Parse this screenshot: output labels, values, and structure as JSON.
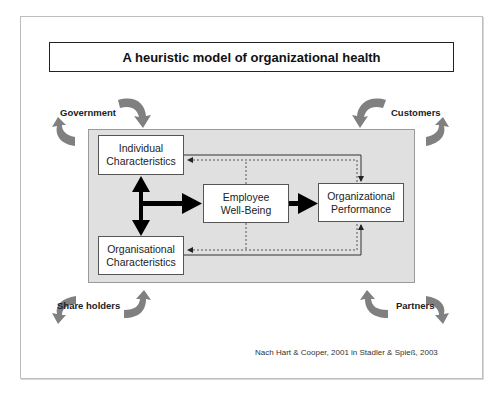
{
  "title": "A heuristic model of organizational health",
  "nodes": {
    "individual": "Individual\nCharacteristics",
    "organisational": "Organisational\nCharacteristics",
    "employee": "Employee\nWell-Being",
    "performance": "Organizational\nPerformance"
  },
  "stakeholders": {
    "government": "Government",
    "customers": "Customers",
    "shareholders": "Share holders",
    "partners": "Partners"
  },
  "citation": "Nach Hart & Cooper, 2001 in Stadler & Spieß, 2003",
  "colors": {
    "panel": "#e0e0e0",
    "curved_arrow": "#808080",
    "arrow": "#000000"
  }
}
